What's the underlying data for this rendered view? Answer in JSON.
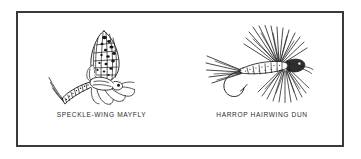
{
  "figure": {
    "background_color": "#ffffff",
    "border_color": "#3a3a3c",
    "ink_color": "#1a1a1a",
    "specimens": [
      {
        "id": "speckle-wing-mayfly",
        "caption": "SPECKLE-WING MAYFLY",
        "kind": "natural-insect-illustration",
        "description": "Side view line drawing of a natural mayfly dun with mottled upright wing, tapered segmented abdomen, three long tails and six legs"
      },
      {
        "id": "harrop-hairwing-dun",
        "caption": "HARROP HAIRWING DUN",
        "kind": "artificial-fly-illustration",
        "description": "Side view line drawing of an artificial dry fly tied on a hook with flared hairwing, dubbed body, split hackle fibers and tail fibers"
      }
    ]
  }
}
